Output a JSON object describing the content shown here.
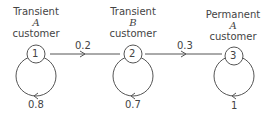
{
  "diagram": {
    "type": "markov-chain",
    "states": [
      {
        "id": "1",
        "line1": "Transient",
        "line2": "A",
        "line3": "customer",
        "self_loop": "0.8"
      },
      {
        "id": "2",
        "line1": "Transient",
        "line2": "B",
        "line3": "customer",
        "self_loop": "0.7"
      },
      {
        "id": "3",
        "line1": "Permanent",
        "line2": "A",
        "line3": "customer",
        "self_loop": "1"
      }
    ],
    "transitions": [
      {
        "from": "1",
        "to": "2",
        "label": "0.2"
      },
      {
        "from": "2",
        "to": "3",
        "label": "0.3"
      }
    ]
  }
}
